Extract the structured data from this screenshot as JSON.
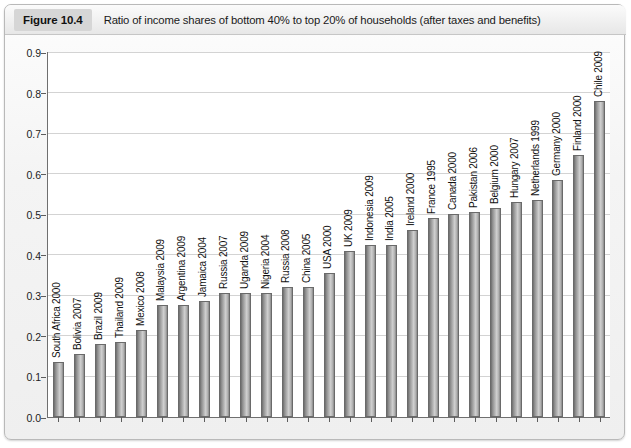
{
  "figure": {
    "number": "Figure 10.4",
    "caption": "Ratio of income shares of bottom 40% to top 20% of households (after taxes and benefits)"
  },
  "chart_data": {
    "type": "bar",
    "title": "Ratio of income shares of bottom 40% to top 20% of households (after taxes and benefits)",
    "xlabel": "",
    "ylabel": "",
    "ylim": [
      0.0,
      0.9
    ],
    "ytick_labels": [
      "0.0",
      "0.1",
      "0.2",
      "0.3",
      "0.4",
      "0.5",
      "0.6",
      "0.7",
      "0.8",
      "0.9"
    ],
    "ytick_values": [
      0.0,
      0.1,
      0.2,
      0.3,
      0.4,
      0.5,
      0.6,
      0.7,
      0.8,
      0.9
    ],
    "grid": true,
    "legend": false,
    "categories": [
      "South Africa 2000",
      "Bolivia 2007",
      "Brazil 2009",
      "Thailand 2009",
      "Mexico 2008",
      "Malaysia 2009",
      "Argentina 2009",
      "Jamaica 2004",
      "Russia 2007",
      "Uganda 2009",
      "Nigeria 2004",
      "Russia 2008",
      "China 2005",
      "USA 2000",
      "UK 2009",
      "Indonesia 2009",
      "India 2005",
      "Ireland 2000",
      "France 1995",
      "Canada 2000",
      "Pakistan 2006",
      "Belgium 2000",
      "Hungary 2007",
      "Netherlands 1999",
      "Germany 2000",
      "Finland 2000",
      "Chile 2009"
    ],
    "values": [
      0.135,
      0.155,
      0.18,
      0.185,
      0.215,
      0.275,
      0.275,
      0.285,
      0.305,
      0.305,
      0.305,
      0.32,
      0.32,
      0.355,
      0.41,
      0.425,
      0.425,
      0.46,
      0.49,
      0.5,
      0.505,
      0.515,
      0.53,
      0.535,
      0.585,
      0.645,
      0.78
    ]
  }
}
